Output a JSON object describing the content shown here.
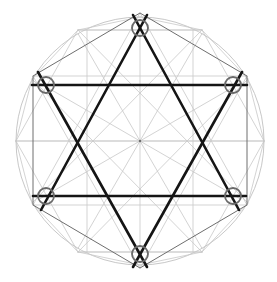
{
  "diagram": {
    "width": 277,
    "height": 282,
    "center": [
      140,
      141
    ],
    "outer_circle_radius": 124,
    "colors": {
      "background": "#ffffff",
      "construction_light": "#c8c8c8",
      "construction_dark": "#6e6e6e",
      "star_stroke": "#151515",
      "vertex_marker": "#6a6a6a"
    },
    "outer_hexagon": [
      [
        140,
        13
      ],
      [
        247,
        76
      ],
      [
        247,
        205
      ],
      [
        140,
        268
      ],
      [
        33,
        205
      ],
      [
        33,
        76
      ]
    ],
    "inner_dodecagon_points": [
      [
        16,
        141
      ],
      [
        32,
        79
      ],
      [
        78,
        30
      ],
      [
        140,
        17
      ],
      [
        202,
        30
      ],
      [
        248,
        79
      ],
      [
        264,
        141
      ],
      [
        248,
        203
      ],
      [
        202,
        252
      ],
      [
        140,
        265
      ],
      [
        78,
        252
      ],
      [
        32,
        203
      ]
    ],
    "star_lines": [
      {
        "name": "upward-left-edge",
        "from": [
          41,
          210
        ],
        "to": [
          147,
          15
        ]
      },
      {
        "name": "upward-right-edge",
        "from": [
          239,
          210
        ],
        "to": [
          133,
          15
        ]
      },
      {
        "name": "upward-base",
        "from": [
          33,
          196
        ],
        "to": [
          246,
          196
        ]
      },
      {
        "name": "downward-left-edge",
        "from": [
          38,
          72
        ],
        "to": [
          147,
          267
        ]
      },
      {
        "name": "downward-right-edge",
        "from": [
          242,
          72
        ],
        "to": [
          133,
          267
        ]
      },
      {
        "name": "downward-base",
        "from": [
          32,
          85
        ],
        "to": [
          247,
          85
        ]
      }
    ],
    "vertex_markers": [
      {
        "name": "top",
        "cx": 140,
        "cy": 28,
        "r": 8
      },
      {
        "name": "upper-left",
        "cx": 46,
        "cy": 85,
        "r": 8
      },
      {
        "name": "upper-right",
        "cx": 233,
        "cy": 85,
        "r": 8
      },
      {
        "name": "lower-left",
        "cx": 46,
        "cy": 196,
        "r": 8
      },
      {
        "name": "lower-right",
        "cx": 233,
        "cy": 196,
        "r": 8
      },
      {
        "name": "bottom",
        "cx": 140,
        "cy": 254,
        "r": 8
      }
    ],
    "radial_line_count": 12
  }
}
